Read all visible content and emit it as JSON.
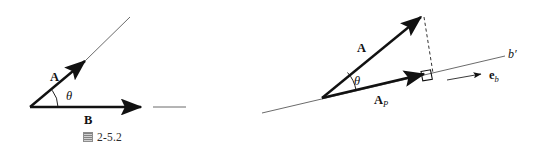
{
  "page": {
    "background": "#ffffff",
    "ink": "#111111",
    "thin_line_color": "#5a5a5a",
    "width": 538,
    "height": 161
  },
  "figures": [
    {
      "id": "fig-2-5-2",
      "caption": {
        "glyph": "cjk-tu-character-icon",
        "glyph_text": "图",
        "number": "2-5.2"
      },
      "labels": {
        "vector_a": "A",
        "vector_b": "B",
        "angle": "θ"
      },
      "geometry": {
        "origin": [
          30,
          107
        ],
        "a_tip": [
          88,
          58
        ],
        "a_extension_end": [
          130,
          17
        ],
        "b_tip": [
          145,
          107
        ],
        "b_extension_start": [
          153,
          107
        ],
        "b_extension_end": [
          186,
          107
        ],
        "arc_radius": 28
      }
    },
    {
      "id": "fig-2-5-3",
      "caption": {
        "glyph": "cjk-tu-character-icon",
        "glyph_text": "图",
        "number": "2-5.3"
      },
      "labels": {
        "vector_a": "A",
        "vector_ap_main": "A",
        "vector_ap_sub": "P",
        "angle": "θ",
        "axis_b": "b",
        "axis_b_prime": "b′",
        "unit_vector_main": "e",
        "unit_vector_sub": "b"
      },
      "geometry": {
        "vertex": [
          322,
          98
        ],
        "a_tip": [
          424,
          14
        ],
        "ap_tip": [
          428,
          78
        ],
        "axis_start": [
          262,
          113
        ],
        "axis_end": [
          505,
          56
        ],
        "dashed_from": [
          424,
          16
        ],
        "dashed_to": [
          432,
          73
        ],
        "unit_arrow_from": [
          447,
          79
        ],
        "unit_arrow_to": [
          482,
          73
        ],
        "right_angle_size": 9
      }
    }
  ]
}
